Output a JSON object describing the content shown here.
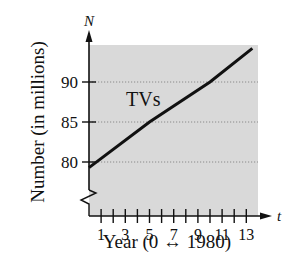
{
  "chart_data": {
    "type": "line",
    "title": "",
    "xlabel": "Year (0 ↔ 1980)",
    "ylabel": "Number (in millions)",
    "x_axis_var": "t",
    "y_axis_var": "N",
    "x_ticks": [
      1,
      2,
      3,
      4,
      5,
      6,
      7,
      8,
      9,
      10,
      11,
      12,
      13
    ],
    "x_tick_labels": [
      "1",
      "3",
      "5",
      "7",
      "9",
      "11",
      "13"
    ],
    "y_ticks": [
      80,
      85,
      90
    ],
    "y_tick_labels": [
      "80",
      "85",
      "90"
    ],
    "xlim": [
      0,
      13.5
    ],
    "ylim": [
      77,
      95
    ],
    "y_axis_break": true,
    "grid": "horizontal dotted at y ticks",
    "background": "#d9d9d9",
    "series": [
      {
        "name": "TVs",
        "label": "TVs",
        "x": [
          0,
          5,
          10,
          13.5
        ],
        "values": [
          79.3,
          85,
          90,
          94.2
        ],
        "color": "#111111"
      }
    ]
  }
}
